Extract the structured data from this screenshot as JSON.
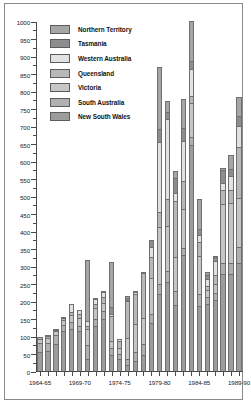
{
  "chart_data": {
    "type": "bar",
    "subtype": "stacked-vertical",
    "title": "",
    "xlabel": "",
    "ylabel": "",
    "ylim": [
      0,
      1000
    ],
    "ytick_step": 50,
    "yticks": [
      0,
      50,
      100,
      150,
      200,
      250,
      300,
      350,
      400,
      450,
      500,
      550,
      600,
      650,
      700,
      750,
      800,
      850,
      900,
      950,
      1000
    ],
    "ytick_labels": [
      "0",
      "50",
      "100",
      "150",
      "200",
      "250",
      "300",
      "350",
      "400",
      "450",
      "500",
      "550",
      "600",
      "650",
      "700",
      "750",
      "800",
      "850",
      "900",
      "950",
      "1000"
    ],
    "grid": false,
    "legend_position": "upper-left-inside",
    "categories": [
      "1964-65",
      "1965-66",
      "1966-67",
      "1967-68",
      "1968-69",
      "1969-70",
      "1970-71",
      "1971-72",
      "1972-73",
      "1973-74",
      "1974-75",
      "1975-76",
      "1976-77",
      "1977-78",
      "1978-79",
      "1979-80",
      "1980-81",
      "1981-82",
      "1982-83",
      "1983-84",
      "1984-85",
      "1985-86",
      "1986-87",
      "1987-88",
      "1988-89",
      "1989-90"
    ],
    "xtick_labels": [
      "1964-65",
      "1969-70",
      "1974-75",
      "1979-80",
      "1984-85",
      "1989-90"
    ],
    "xtick_label_indices": [
      0,
      5,
      10,
      15,
      20,
      25
    ],
    "series": [
      {
        "name": "New South Wales",
        "color": "#9c9c9c",
        "values": [
          53,
          56,
          78,
          113,
          120,
          114,
          35,
          128,
          148,
          45,
          33,
          18,
          30,
          46,
          137,
          220,
          255,
          188,
          332,
          645,
          185,
          192,
          202,
          278,
          278,
          310
        ]
      },
      {
        "name": "South Australia",
        "color": "#b0b0b0",
        "values": [
          27,
          25,
          25,
          18,
          20,
          16,
          40,
          22,
          24,
          20,
          17,
          17,
          25,
          30,
          25,
          28,
          30,
          42,
          20,
          25,
          35,
          20,
          22,
          30,
          32,
          45
        ]
      },
      {
        "name": "Victoria",
        "color": "#c6c6c6",
        "values": [
          12,
          14,
          10,
          14,
          20,
          22,
          45,
          30,
          22,
          20,
          15,
          60,
          78,
          75,
          105,
          164,
          130,
          95,
          112,
          95,
          110,
          20,
          25,
          170,
          170,
          140
        ]
      },
      {
        "name": "Queensland",
        "color": "#b8b8b8",
        "values": [
          6,
          5,
          5,
          6,
          10,
          12,
          10,
          12,
          18,
          72,
          22,
          104,
          86,
          128,
          58,
          42,
          76,
          162,
          80,
          22,
          38,
          10,
          24,
          38,
          38,
          145
        ]
      },
      {
        "name": "Western Australia",
        "color": "#e2e2e2",
        "values": [
          0,
          4,
          2,
          2,
          22,
          10,
          12,
          14,
          14,
          5,
          4,
          2,
          6,
          2,
          28,
          200,
          230,
          22,
          112,
          75,
          20,
          20,
          40,
          22,
          38,
          60
        ]
      },
      {
        "name": "Tasmania",
        "color": "#8d8d8d",
        "values": [
          0,
          0,
          0,
          0,
          0,
          0,
          0,
          0,
          4,
          20,
          0,
          8,
          0,
          0,
          22,
          38,
          18,
          42,
          38,
          24,
          18,
          12,
          14,
          35,
          22,
          28
        ]
      },
      {
        "name": "Northern Territory",
        "color": "#a6a6a6",
        "values": [
          0,
          0,
          0,
          0,
          0,
          0,
          175,
          4,
          0,
          130,
          0,
          4,
          2,
          0,
          0,
          178,
          32,
          20,
          84,
          115,
          86,
          8,
          2,
          8,
          38,
          55
        ]
      }
    ]
  },
  "legend": {
    "items": [
      {
        "label": "Northern Territory",
        "color": "#a6a6a6"
      },
      {
        "label": "Tasmania",
        "color": "#8d8d8d"
      },
      {
        "label": "Western Australia",
        "color": "#e2e2e2"
      },
      {
        "label": "Queensland",
        "color": "#b8b8b8"
      },
      {
        "label": "Victoria",
        "color": "#c6c6c6"
      },
      {
        "label": "South Australia",
        "color": "#b0b0b0"
      },
      {
        "label": "New South Wales",
        "color": "#9c9c9c"
      }
    ]
  }
}
